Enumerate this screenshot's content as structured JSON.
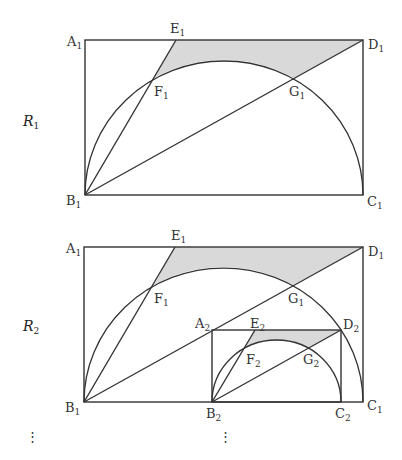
{
  "figures": [
    {
      "name": "R1",
      "label": {
        "main": "R",
        "sub": "1"
      },
      "points": {
        "A1": {
          "main": "A",
          "sub": "1"
        },
        "B1": {
          "main": "B",
          "sub": "1"
        },
        "C1": {
          "main": "C",
          "sub": "1"
        },
        "D1": {
          "main": "D",
          "sub": "1"
        },
        "E1": {
          "main": "E",
          "sub": "1"
        },
        "F1": {
          "main": "F",
          "sub": "1"
        },
        "G1": {
          "main": "G",
          "sub": "1"
        }
      }
    },
    {
      "name": "R2",
      "label": {
        "main": "R",
        "sub": "2"
      },
      "points": {
        "A1": {
          "main": "A",
          "sub": "1"
        },
        "B1": {
          "main": "B",
          "sub": "1"
        },
        "C1": {
          "main": "C",
          "sub": "1"
        },
        "D1": {
          "main": "D",
          "sub": "1"
        },
        "E1": {
          "main": "E",
          "sub": "1"
        },
        "F1": {
          "main": "F",
          "sub": "1"
        },
        "G1": {
          "main": "G",
          "sub": "1"
        },
        "A2": {
          "main": "A",
          "sub": "2"
        },
        "B2": {
          "main": "B",
          "sub": "2"
        },
        "C2": {
          "main": "C",
          "sub": "2"
        },
        "D2": {
          "main": "D",
          "sub": "2"
        },
        "E2": {
          "main": "E",
          "sub": "2"
        },
        "F2": {
          "main": "F",
          "sub": "2"
        },
        "G2": {
          "main": "G",
          "sub": "2"
        }
      }
    }
  ],
  "continuation": {
    "dots": "⋮"
  },
  "colors": {
    "stroke": "#333333",
    "shade": "#d9d9d9",
    "background": "#ffffff"
  }
}
